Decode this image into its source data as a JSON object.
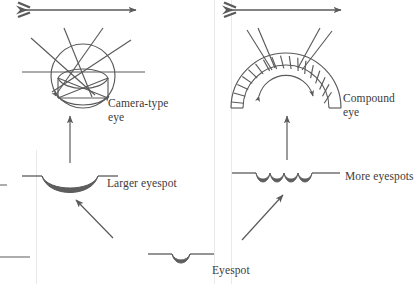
{
  "figure": {
    "background_color": "#ffffff",
    "stroke_color": "#5a5a5a",
    "fill_color": "#5e5e5e",
    "text_color": "#3b3b3b",
    "guide_color": "#e4e4e4",
    "width": 419,
    "height": 284
  },
  "labels": {
    "camera_eye": "Camera-type\neye",
    "compound_eye": "Compound\neye",
    "larger_eyespot": "Larger eyespot",
    "more_eyespots": "More eyespots",
    "eyespot": "Eyespot"
  },
  "stages": [
    {
      "id": "eyespot",
      "label": "Eyespot",
      "description": "flat epithelium with a single small pigment-cup dip",
      "dips": 1,
      "position": "bottom-center"
    },
    {
      "id": "more-eyespots",
      "label": "More eyespots",
      "description": "flat epithelium with four adjacent pigment-cup dips",
      "dips": 4,
      "position": "middle-right"
    },
    {
      "id": "larger-eyespot",
      "label": "Larger eyespot",
      "description": "single broad deep pigment cup",
      "dips": 1,
      "position": "middle-left"
    },
    {
      "id": "camera-type-eye",
      "label": "Camera-type eye",
      "description": "closed spherical eye with lens focusing crossed light rays onto retina",
      "position": "top-left"
    },
    {
      "id": "compound-eye",
      "label": "Compound eye",
      "description": "convex dome of radially arranged ommatidia",
      "ommatidia_count": 19,
      "position": "top-right"
    }
  ],
  "arrows": {
    "light_arrow_label": "incoming light",
    "count_light_arrows": 2,
    "transition_arrows": [
      "eyespot to more eyespots",
      "eyespot to larger eyespot",
      "larger eyespot to camera-type eye",
      "more eyespots to compound eye"
    ]
  },
  "icons": {
    "arrow": "arrow-icon",
    "fletched-arrow": "fletched-arrow-icon"
  }
}
